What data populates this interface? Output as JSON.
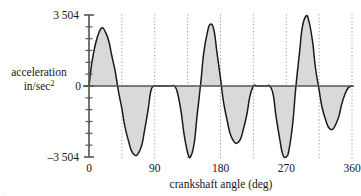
{
  "chart_data": {
    "type": "line",
    "title": "",
    "xlabel": "crankshaft angle  (deg)",
    "ylabel_line1": "acceleration",
    "ylabel_line2": "in/sec",
    "ylabel_exponent": "2",
    "xlim": [
      0,
      360
    ],
    "ylim": [
      -3504,
      3504
    ],
    "xticks": [
      0,
      90,
      180,
      270,
      360
    ],
    "xticklabels": [
      "0",
      "90",
      "180",
      "270",
      "360"
    ],
    "yticks": [
      -3504,
      3504
    ],
    "yticklabels": [
      "–3 504",
      "3 504"
    ],
    "ytick_top_label": "3 504",
    "ytick_zero_label": "0",
    "ytick_bottom_label": "–3 504",
    "y_minor_tick_count": 12,
    "grid": "vertical dotted gridlines",
    "gridline_x_values": [
      0,
      45,
      90,
      135,
      180,
      225,
      270,
      315,
      360
    ],
    "fill_color": "#d9d9d9",
    "line_color": "#1a1a1a",
    "axis_color": "#555555",
    "grid_color": "#9a9a9a",
    "series": [
      {
        "name": "acceleration",
        "x": [
          0,
          4,
          9,
          14,
          18,
          22,
          27,
          31,
          36,
          40,
          45,
          49,
          54,
          58,
          63,
          67,
          72,
          76,
          81,
          85,
          90,
          94,
          99,
          103,
          108,
          112,
          117,
          121,
          126,
          130,
          135,
          139,
          144,
          148,
          153,
          157,
          162,
          166,
          171,
          175,
          180,
          184,
          189,
          193,
          198,
          202,
          207,
          211,
          216,
          220,
          225,
          229,
          234,
          238,
          243,
          247,
          252,
          256,
          261,
          265,
          270,
          274,
          279,
          283,
          288,
          292,
          297,
          301,
          306,
          310,
          315,
          319,
          324,
          328,
          333,
          337,
          342,
          346,
          351,
          355,
          360
        ],
        "y": [
          0,
          1180,
          2100,
          2680,
          2870,
          2700,
          2230,
          1530,
          700,
          -200,
          -1120,
          -1980,
          -2700,
          -3190,
          -3420,
          -3350,
          -2950,
          -2200,
          -1150,
          -200,
          0,
          0,
          0,
          0,
          0,
          0,
          0,
          -320,
          -1250,
          -2350,
          -3280,
          -3490,
          -2820,
          -1450,
          160,
          1620,
          2640,
          3050,
          2760,
          1700,
          380,
          -760,
          -1680,
          -2330,
          -2720,
          -2830,
          -2650,
          -2180,
          -1420,
          -550,
          0,
          0,
          0,
          0,
          0,
          0,
          -400,
          -1500,
          -2600,
          -3350,
          -3504,
          -3100,
          -1800,
          -100,
          1600,
          2900,
          3450,
          3200,
          2200,
          900,
          -200,
          -1050,
          -1680,
          -2050,
          -2150,
          -1950,
          -1500,
          -880,
          -350,
          -80,
          0
        ]
      }
    ]
  },
  "footer_mark": "."
}
